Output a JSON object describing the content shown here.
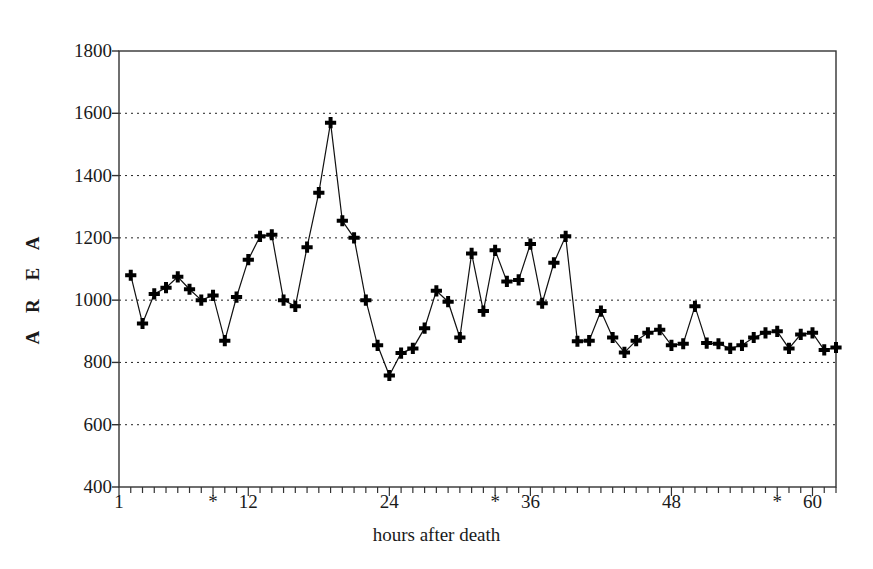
{
  "chart_data": {
    "type": "line",
    "title": "",
    "subtitle": "",
    "xlabel": "hours after death",
    "ylabel": "A R E A",
    "ylim": [
      400,
      1800
    ],
    "xlim": [
      1,
      62
    ],
    "grid": true,
    "grid_axis": "y",
    "legend": null,
    "marker": "plus",
    "line_color": "#111111",
    "marker_color": "#000000",
    "background": "#ffffff",
    "yticks": [
      400,
      600,
      800,
      1000,
      1200,
      1400,
      1600,
      1800
    ],
    "ytick_labels": [
      "400",
      "600",
      "800",
      "1000",
      "1200",
      "1400",
      "1600",
      "1800"
    ],
    "xticks": [
      1,
      9,
      12,
      24,
      33,
      36,
      48,
      57,
      60
    ],
    "xtick_labels": [
      "1",
      "*",
      "12",
      "24",
      "*",
      "36",
      "48",
      "*",
      "60"
    ],
    "x": [
      2,
      3,
      4,
      5,
      6,
      7,
      8,
      9,
      10,
      11,
      12,
      13,
      14,
      15,
      16,
      17,
      18,
      19,
      20,
      21,
      22,
      23,
      24,
      25,
      26,
      27,
      28,
      29,
      30,
      31,
      32,
      33,
      34,
      35,
      36,
      37,
      38,
      39,
      40,
      41,
      42,
      43,
      44,
      45,
      46,
      47,
      48,
      49,
      50,
      51,
      52,
      53,
      54,
      55,
      56,
      57,
      58,
      59,
      60,
      61,
      62
    ],
    "y": [
      1080,
      925,
      1020,
      1040,
      1075,
      1035,
      1000,
      1015,
      870,
      1010,
      1130,
      1205,
      1210,
      1000,
      980,
      1170,
      1345,
      1570,
      1255,
      1200,
      1000,
      855,
      758,
      830,
      845,
      910,
      1030,
      995,
      880,
      1150,
      965,
      1160,
      1060,
      1065,
      1180,
      990,
      1120,
      1205,
      868,
      870,
      965,
      880,
      832,
      870,
      895,
      905,
      855,
      860,
      980,
      862,
      860,
      845,
      855,
      880,
      895,
      900,
      845,
      890,
      895,
      840,
      848
    ],
    "series": [
      {
        "name": "AREA",
        "values": [
          1080,
          925,
          1020,
          1040,
          1075,
          1035,
          1000,
          1015,
          870,
          1010,
          1130,
          1205,
          1210,
          1000,
          980,
          1170,
          1345,
          1570,
          1255,
          1200,
          1000,
          855,
          758,
          830,
          845,
          910,
          1030,
          995,
          880,
          1150,
          965,
          1160,
          1060,
          1065,
          1180,
          990,
          1120,
          1205,
          868,
          870,
          965,
          880,
          832,
          870,
          895,
          905,
          855,
          860,
          980,
          862,
          860,
          845,
          855,
          880,
          895,
          900,
          845,
          890,
          895,
          840,
          848
        ]
      }
    ],
    "annotations": [
      {
        "label": "*",
        "x": 9,
        "axis": "x"
      },
      {
        "label": "*",
        "x": 33,
        "axis": "x"
      },
      {
        "label": "*",
        "x": 57,
        "axis": "x"
      }
    ],
    "max_value": 1570,
    "min_value": 758
  }
}
